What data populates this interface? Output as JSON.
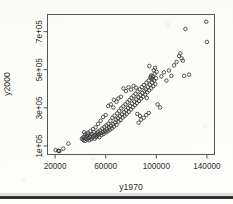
{
  "figure": {
    "kind": "scatter-plot",
    "background_color": "#fdfdfb",
    "point_color": "#3a3a3a",
    "axis_color": "#4d4d4d"
  },
  "chart_data": {
    "type": "scatter",
    "title": "",
    "xlabel": "y1970",
    "ylabel": "y2000",
    "xlim": [
      14000,
      146000
    ],
    "ylim": [
      55000,
      790000
    ],
    "grid": false,
    "legend": null,
    "marker": "open-circle",
    "xticks": [
      20000,
      60000,
      100000,
      140000
    ],
    "xtick_labels": [
      "20000",
      "60000",
      "100000",
      "140000"
    ],
    "yticks": [
      100000,
      300000,
      500000,
      700000
    ],
    "ytick_labels": [
      "1e+05",
      "3e+05",
      "5e+05",
      "7e+05"
    ],
    "n_points": 163,
    "points": [
      [
        20400,
        78000
      ],
      [
        22600,
        74000
      ],
      [
        23100,
        73500
      ],
      [
        23400,
        73000
      ],
      [
        26500,
        86000
      ],
      [
        30500,
        112000
      ],
      [
        41200,
        137000
      ],
      [
        41800,
        144000
      ],
      [
        42400,
        131000
      ],
      [
        43000,
        148000
      ],
      [
        43600,
        126000
      ],
      [
        44200,
        139000
      ],
      [
        44800,
        152000
      ],
      [
        45300,
        133000
      ],
      [
        45900,
        160000
      ],
      [
        46400,
        141000
      ],
      [
        47000,
        129000
      ],
      [
        47500,
        147000
      ],
      [
        48100,
        155000
      ],
      [
        48600,
        136000
      ],
      [
        49200,
        163000
      ],
      [
        49700,
        143000
      ],
      [
        50300,
        151000
      ],
      [
        50800,
        172000
      ],
      [
        51300,
        138000
      ],
      [
        51900,
        158000
      ],
      [
        52400,
        147000
      ],
      [
        53000,
        166000
      ],
      [
        53500,
        153000
      ],
      [
        54000,
        175000
      ],
      [
        54600,
        161000
      ],
      [
        55100,
        146000
      ],
      [
        55700,
        182000
      ],
      [
        56200,
        168000
      ],
      [
        56700,
        157000
      ],
      [
        57300,
        191000
      ],
      [
        57800,
        173000
      ],
      [
        58400,
        163000
      ],
      [
        58900,
        199000
      ],
      [
        59400,
        180000
      ],
      [
        60000,
        171000
      ],
      [
        60500,
        208000
      ],
      [
        61000,
        188000
      ],
      [
        61600,
        177000
      ],
      [
        62100,
        216000
      ],
      [
        62700,
        196000
      ],
      [
        63200,
        184000
      ],
      [
        63700,
        232000
      ],
      [
        64300,
        205000
      ],
      [
        64800,
        192000
      ],
      [
        65300,
        248000
      ],
      [
        65900,
        214000
      ],
      [
        66400,
        201000
      ],
      [
        67000,
        259000
      ],
      [
        67500,
        223000
      ],
      [
        68000,
        238000
      ],
      [
        68600,
        211000
      ],
      [
        69100,
        271000
      ],
      [
        69700,
        245000
      ],
      [
        70200,
        228000
      ],
      [
        70700,
        284000
      ],
      [
        71300,
        256000
      ],
      [
        71800,
        236000
      ],
      [
        72300,
        297000
      ],
      [
        72900,
        266000
      ],
      [
        73400,
        249000
      ],
      [
        74000,
        308000
      ],
      [
        74500,
        277000
      ],
      [
        75000,
        258000
      ],
      [
        75600,
        318000
      ],
      [
        76100,
        288000
      ],
      [
        76600,
        268000
      ],
      [
        77200,
        329000
      ],
      [
        77700,
        299000
      ],
      [
        78300,
        279000
      ],
      [
        78800,
        341000
      ],
      [
        79300,
        310000
      ],
      [
        79900,
        291000
      ],
      [
        80400,
        352000
      ],
      [
        80900,
        322000
      ],
      [
        81500,
        303000
      ],
      [
        82000,
        363000
      ],
      [
        82600,
        333000
      ],
      [
        83100,
        314000
      ],
      [
        83600,
        374000
      ],
      [
        84200,
        345000
      ],
      [
        84700,
        325000
      ],
      [
        85200,
        386000
      ],
      [
        85800,
        356000
      ],
      [
        86300,
        336000
      ],
      [
        86900,
        397000
      ],
      [
        87400,
        367000
      ],
      [
        87900,
        348000
      ],
      [
        88500,
        409000
      ],
      [
        89000,
        378000
      ],
      [
        89600,
        359000
      ],
      [
        90100,
        420000
      ],
      [
        90600,
        390000
      ],
      [
        91200,
        370000
      ],
      [
        91700,
        398000
      ],
      [
        92200,
        432000
      ],
      [
        92800,
        381000
      ],
      [
        93300,
        410000
      ],
      [
        93900,
        443000
      ],
      [
        94400,
        392000
      ],
      [
        94900,
        421000
      ],
      [
        95500,
        455000
      ],
      [
        96000,
        403000
      ],
      [
        96600,
        432000
      ],
      [
        97100,
        466000
      ],
      [
        97600,
        414000
      ],
      [
        98200,
        444000
      ],
      [
        98700,
        478000
      ],
      [
        99200,
        425000
      ],
      [
        99800,
        455000
      ],
      [
        100300,
        489000
      ],
      [
        62000,
        310000
      ],
      [
        64000,
        318000
      ],
      [
        66000,
        302000
      ],
      [
        74000,
        402000
      ],
      [
        78000,
        408000
      ],
      [
        82000,
        415000
      ],
      [
        70000,
        349000
      ],
      [
        72000,
        358000
      ],
      [
        88000,
        238000
      ],
      [
        90000,
        248000
      ],
      [
        92000,
        262000
      ],
      [
        86000,
        222000
      ],
      [
        94000,
        273000
      ],
      [
        96000,
        470000
      ],
      [
        98000,
        497000
      ],
      [
        99000,
        510000
      ],
      [
        94500,
        520000
      ],
      [
        95500,
        462000
      ],
      [
        97000,
        452000
      ],
      [
        101000,
        318000
      ],
      [
        103000,
        302000
      ],
      [
        104000,
        465000
      ],
      [
        106000,
        486000
      ],
      [
        108000,
        443000
      ],
      [
        110000,
        496000
      ],
      [
        112000,
        468000
      ],
      [
        114000,
        523000
      ],
      [
        116000,
        541000
      ],
      [
        118000,
        572000
      ],
      [
        119000,
        586000
      ],
      [
        120000,
        560000
      ],
      [
        121000,
        548000
      ],
      [
        122000,
        468000
      ],
      [
        123000,
        714000
      ],
      [
        126000,
        474000
      ],
      [
        139500,
        752000
      ],
      [
        140000,
        646000
      ],
      [
        85000,
        268000
      ],
      [
        87000,
        258000
      ],
      [
        66500,
        342000
      ],
      [
        68500,
        332000
      ],
      [
        60000,
        262000
      ],
      [
        58000,
        252000
      ],
      [
        56000,
        232000
      ],
      [
        54000,
        216000
      ],
      [
        52000,
        198000
      ],
      [
        50000,
        188000
      ],
      [
        48000,
        178000
      ],
      [
        46000,
        169000
      ],
      [
        44000,
        161000
      ],
      [
        43000,
        172000
      ],
      [
        76000,
        388000
      ],
      [
        80000,
        396000
      ],
      [
        84000,
        406000
      ],
      [
        92500,
        352000
      ]
    ]
  }
}
